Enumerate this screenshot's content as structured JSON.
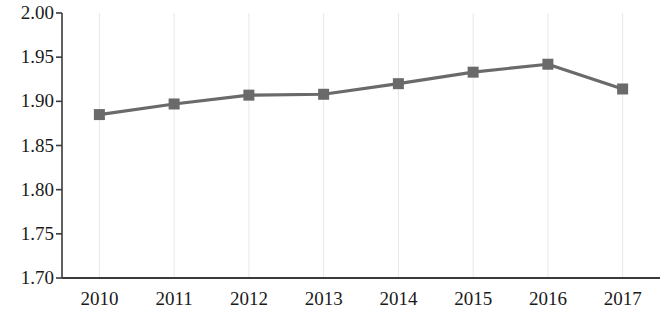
{
  "chart_data": {
    "type": "line",
    "title": "",
    "subtitle": "",
    "xlabel": "",
    "ylabel": "",
    "categories": [
      "2010",
      "2011",
      "2012",
      "2013",
      "2014",
      "2015",
      "2016",
      "2017"
    ],
    "values": [
      1.885,
      1.897,
      1.907,
      1.908,
      1.92,
      1.933,
      1.942,
      1.914
    ],
    "series": [
      {
        "name": "series-1",
        "values": [
          1.885,
          1.897,
          1.907,
          1.908,
          1.92,
          1.933,
          1.942,
          1.914
        ]
      }
    ],
    "ylim": [
      1.7,
      2.0
    ],
    "ytick_labels": [
      "2.00",
      "1.95",
      "1.90",
      "1.85",
      "1.80",
      "1.75",
      "1.70"
    ],
    "ytick_values": [
      2.0,
      1.95,
      1.9,
      1.85,
      1.8,
      1.75,
      1.7
    ],
    "xtick_labels": [
      "2010",
      "2011",
      "2012",
      "2013",
      "2014",
      "2015",
      "2016",
      "2017"
    ],
    "grid": {
      "vertical": true,
      "horizontal": false
    },
    "legend": {
      "visible": false,
      "position": "none"
    },
    "marker": "square",
    "colors": {
      "line": "#6a6a6a",
      "marker": "#6a6a6a",
      "axis": "#3a3a3a",
      "gridline": "#e8e8e8",
      "text": "#1a1a1a",
      "background": "#ffffff"
    }
  }
}
